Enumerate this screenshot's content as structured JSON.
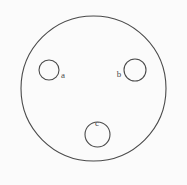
{
  "figure": {
    "kind": "venn-like-region-diagram",
    "background_color": "#fbfbfb",
    "stroke_color": "#4a4a4a",
    "label_color": "#4a4a4a",
    "stroke_width": 1.1,
    "canvas": {
      "width": 187,
      "height": 185
    }
  },
  "outer_circle": {
    "name": "outer-boundary-circle",
    "cx": 93.5,
    "cy": 88.5,
    "r": 72.5,
    "fill": "none"
  },
  "inner_circles": [
    {
      "id": "a",
      "label": "a",
      "cx": 49,
      "cy": 70,
      "r": 10,
      "label_x": 63,
      "label_y": 75,
      "label_position": "right"
    },
    {
      "id": "b",
      "label": "b",
      "cx": 135,
      "cy": 70,
      "r": 11,
      "label_x": 119,
      "label_y": 74,
      "label_position": "left"
    },
    {
      "id": "c",
      "label": "c",
      "cx": 97.5,
      "cy": 134.5,
      "r": 12.5,
      "label_x": 97,
      "label_y": 123,
      "label_position": "top"
    }
  ]
}
